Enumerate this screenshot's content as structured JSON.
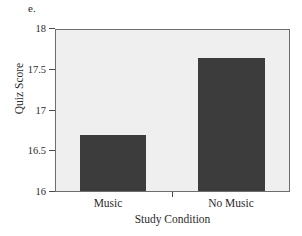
{
  "panel": {
    "letter": "e."
  },
  "chart_data": {
    "type": "bar",
    "title": "",
    "subtitle": "",
    "xlabel": "Study Condition",
    "ylabel": "Quiz Score",
    "categories": [
      "Music",
      "No Music"
    ],
    "values": [
      16.7,
      17.65
    ],
    "series": [
      {
        "name": "Quiz Score",
        "values": [
          16.7,
          17.65
        ]
      }
    ],
    "ylim": [
      16,
      18
    ],
    "yticks": [
      16,
      16.5,
      17,
      17.5,
      18
    ],
    "ytick_labels": [
      "16",
      "16.5",
      "17",
      "17.5",
      "18"
    ],
    "xtick_labels": [
      "Music",
      "No Music"
    ],
    "grid": false,
    "legend": "none",
    "colors": {
      "bar": "#3c3c3c",
      "plot_background": "#efefef",
      "frame": "#6d6d6d",
      "text": "#2b2b2b",
      "figure_background": "#ffffff"
    }
  }
}
